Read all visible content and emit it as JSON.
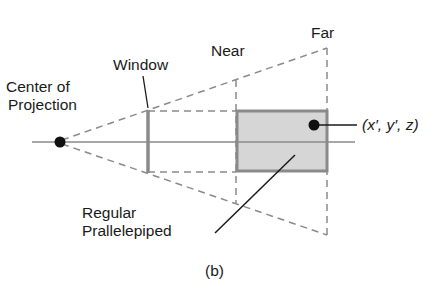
{
  "labels": {
    "center_line1": "Center of",
    "center_line2": "Projection",
    "window": "Window",
    "near": "Near",
    "far": "Far",
    "point": "(x′, y′, z)",
    "regular_line1": "Regular",
    "regular_line2": "Prallelepiped",
    "caption": "(b)"
  },
  "colors": {
    "line": "#1a1a1a",
    "gray_line": "#8a8a8a",
    "dash": "#8a8a8a",
    "box_fill": "#d6d6d6"
  }
}
